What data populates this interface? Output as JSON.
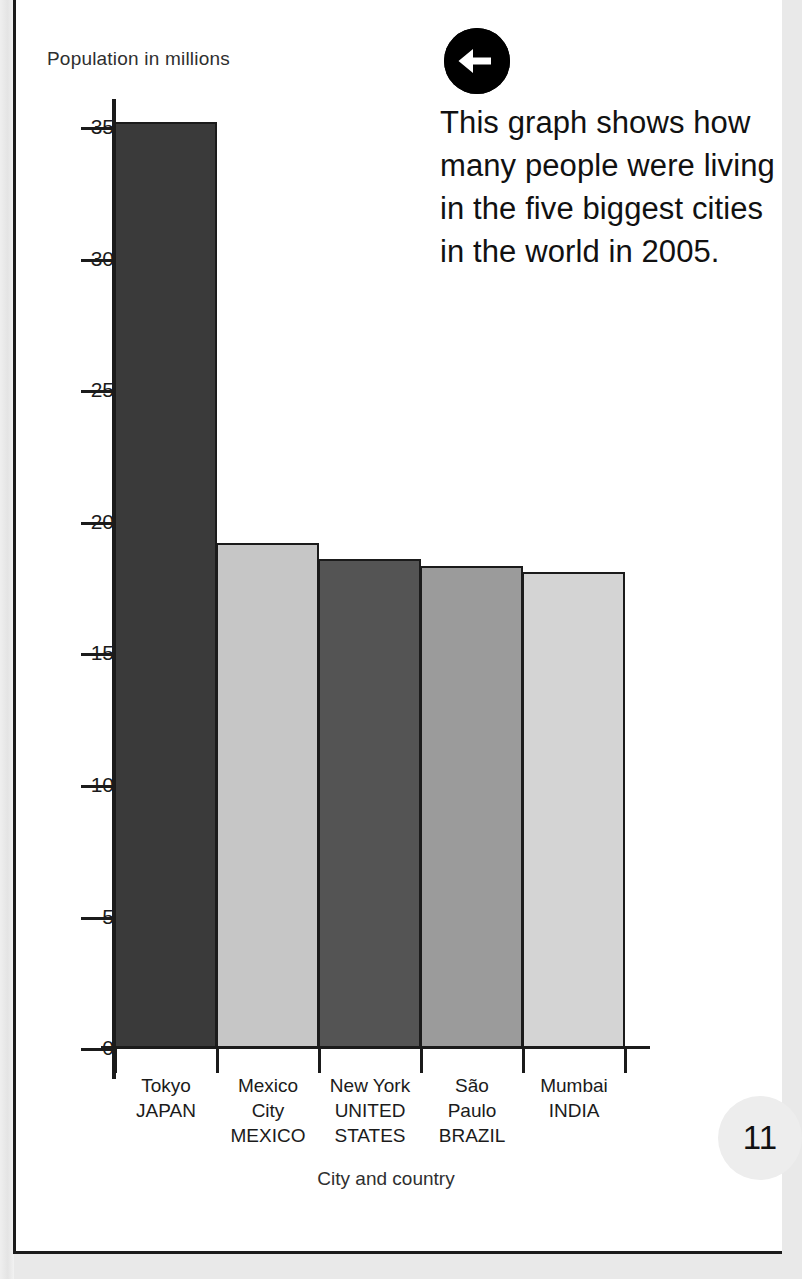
{
  "page": {
    "number": "11",
    "background_color": "#ffffff",
    "border_color": "#1b1b1b"
  },
  "callout": {
    "arrow_icon": "arrow-left-icon",
    "arrow_badge_color": "#000000",
    "text": "This graph shows how many people were living in the five biggest cities in the world in 2005."
  },
  "chart_data": {
    "type": "bar",
    "title": "",
    "ylabel": "Population in millions",
    "xlabel": "City and country",
    "ylim": [
      0,
      36
    ],
    "yticks": [
      0,
      5,
      10,
      15,
      20,
      25,
      30,
      35
    ],
    "ytick_labels": [
      "0",
      "5",
      "10",
      "15",
      "20",
      "25",
      "30",
      "35"
    ],
    "grid": false,
    "legend": false,
    "categories": [
      "Tokyo JAPAN",
      "Mexico City MEXICO",
      "New York UNITED STATES",
      "São Paulo BRAZIL",
      "Mumbai INDIA"
    ],
    "category_lines": [
      [
        "Tokyo",
        "JAPAN"
      ],
      [
        "Mexico",
        "City",
        "MEXICO"
      ],
      [
        "New York",
        "UNITED",
        "STATES"
      ],
      [
        "São",
        "Paulo",
        "BRAZIL"
      ],
      [
        "Mumbai",
        "INDIA"
      ]
    ],
    "values": [
      35.2,
      19.2,
      18.6,
      18.3,
      18.1
    ],
    "bar_colors": [
      "#3a3a3a",
      "#c6c6c6",
      "#545454",
      "#9b9b9b",
      "#d4d4d4"
    ],
    "bar_border_color": "#1b1b1b"
  }
}
